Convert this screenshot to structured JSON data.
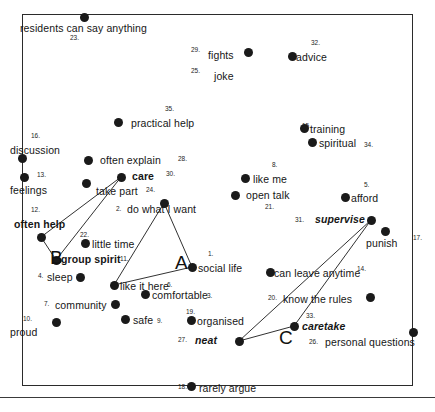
{
  "figure": {
    "type": "scatter",
    "title": "",
    "frame": {
      "x": 22,
      "y": 14,
      "width": 391,
      "height": 372
    },
    "grid": false,
    "legend": false,
    "point_color": "#1a1a1a",
    "frame_color": "#2b2b2b"
  },
  "chart_data": {
    "type": "scatter",
    "title": "",
    "xlabel": "",
    "ylabel": "",
    "grid": false,
    "legend_position": "none",
    "points": [
      {
        "id": 23,
        "label": "residents can say anything",
        "x": 84,
        "y": 17,
        "label_x": 20,
        "label_y": 23,
        "num_x": 70,
        "num_y": 35,
        "style": "plain"
      },
      {
        "id": 29,
        "label": "fights",
        "x": 248,
        "y": 52,
        "label_x": 208,
        "label_y": 50,
        "num_x": 191,
        "num_y": 47,
        "style": "plain"
      },
      {
        "id": 25,
        "label": "joke",
        "x": null,
        "y": null,
        "label_x": 214,
        "label_y": 71,
        "num_x": 191,
        "num_y": 68,
        "style": "plain"
      },
      {
        "id": 32,
        "label": "advice",
        "x": 292,
        "y": 56,
        "label_x": 296,
        "label_y": 52,
        "num_x": 311,
        "num_y": 40,
        "style": "plain"
      },
      {
        "id": 35,
        "label": "practical help",
        "x": 118,
        "y": 122,
        "label_x": 131,
        "label_y": 118,
        "num_x": 165,
        "num_y": 106,
        "style": "plain"
      },
      {
        "id": 15,
        "label": "training",
        "x": 304,
        "y": 128,
        "label_x": 310,
        "label_y": 124,
        "num_x": 302,
        "num_y": 123,
        "style": "plain"
      },
      {
        "id": 34,
        "label": "spiritual",
        "x": 312,
        "y": 142,
        "label_x": 319,
        "label_y": 138,
        "num_x": 364,
        "num_y": 142,
        "style": "plain"
      },
      {
        "id": 16,
        "label": "discussion",
        "x": 22,
        "y": 158,
        "label_x": 10,
        "label_y": 145,
        "num_x": 31,
        "num_y": 133,
        "style": "plain"
      },
      {
        "id": 28,
        "label": "often explain",
        "x": 88,
        "y": 160,
        "label_x": 100,
        "label_y": 155,
        "num_x": 178,
        "num_y": 156,
        "style": "plain"
      },
      {
        "id": 30,
        "label": "care",
        "x": 121,
        "y": 177,
        "label_x": 132,
        "label_y": 171,
        "num_x": 166,
        "num_y": 171,
        "style": "bold"
      },
      {
        "id": 13,
        "label": "feelings",
        "x": 24,
        "y": 177,
        "label_x": 10,
        "label_y": 185,
        "num_x": 37,
        "num_y": 172,
        "style": "plain"
      },
      {
        "id": 24,
        "label": "take part",
        "x": 86,
        "y": 183,
        "label_x": 96,
        "label_y": 186,
        "num_x": 146,
        "num_y": 187,
        "style": "plain"
      },
      {
        "id": 8,
        "label": "like me",
        "x": 245,
        "y": 178,
        "label_x": 253,
        "label_y": 174,
        "num_x": 272,
        "num_y": 162,
        "style": "plain"
      },
      {
        "id": 5,
        "label": "afford",
        "x": 345,
        "y": 197,
        "label_x": 351,
        "label_y": 193,
        "num_x": 364,
        "num_y": 182,
        "style": "plain"
      },
      {
        "id": 21,
        "label": "open talk",
        "x": 235,
        "y": 195,
        "label_x": 246,
        "label_y": 190,
        "num_x": 265,
        "num_y": 204,
        "style": "plain"
      },
      {
        "id": 2,
        "label": "do what I want",
        "x": 164,
        "y": 203,
        "label_x": 127,
        "label_y": 204,
        "num_x": 116,
        "num_y": 206,
        "style": "plain"
      },
      {
        "id": 12,
        "label": "often help",
        "x": 41,
        "y": 237,
        "label_x": 14,
        "label_y": 219,
        "num_x": 31,
        "num_y": 207,
        "style": "bold"
      },
      {
        "id": 31,
        "label": "supervise",
        "x": 371,
        "y": 220,
        "label_x": 315,
        "label_y": 214,
        "num_x": 295,
        "num_y": 217,
        "style": "bolditalic"
      },
      {
        "id": 17,
        "label": "punish",
        "x": 385,
        "y": 231,
        "label_x": 366,
        "label_y": 238,
        "num_x": 413,
        "num_y": 235,
        "style": "plain"
      },
      {
        "id": 22,
        "label": "little time",
        "x": 85,
        "y": 243,
        "label_x": 92,
        "label_y": 239,
        "num_x": 80,
        "num_y": 232,
        "style": "plain"
      },
      {
        "id": 11,
        "label": "group spirit",
        "x": 56,
        "y": 260,
        "label_x": 61,
        "label_y": 254,
        "num_x": 120,
        "num_y": 256,
        "style": "bold"
      },
      {
        "id": 4,
        "label": "sleep",
        "x": 80,
        "y": 277,
        "label_x": 47,
        "label_y": 272,
        "num_x": 38,
        "num_y": 273,
        "style": "plain"
      },
      {
        "id": 1,
        "label": "social life",
        "x": 192,
        "y": 267,
        "label_x": 198,
        "label_y": 263,
        "num_x": 208,
        "num_y": 251,
        "style": "plain"
      },
      {
        "id": 14,
        "label": "can leave anytime",
        "x": 270,
        "y": 272,
        "label_x": 274,
        "label_y": 268,
        "num_x": 357,
        "num_y": 266,
        "style": "plain"
      },
      {
        "id": 6,
        "label": "like it here",
        "x": 114,
        "y": 285,
        "label_x": 120,
        "label_y": 281,
        "num_x": 167,
        "num_y": 282,
        "style": "plain"
      },
      {
        "id": 3,
        "label": "comfortable",
        "x": 145,
        "y": 294,
        "label_x": 152,
        "label_y": 290,
        "num_x": 207,
        "num_y": 293,
        "style": "plain"
      },
      {
        "id": 20,
        "label": "know the rules",
        "x": 370,
        "y": 297,
        "label_x": 283,
        "label_y": 294,
        "num_x": 268,
        "num_y": 295,
        "style": "plain"
      },
      {
        "id": 7,
        "label": "community",
        "x": 115,
        "y": 304,
        "label_x": 55,
        "label_y": 300,
        "num_x": 44,
        "num_y": 301,
        "style": "plain"
      },
      {
        "id": 9,
        "label": "safe",
        "x": 125,
        "y": 319,
        "label_x": 133,
        "label_y": 315,
        "num_x": 157,
        "num_y": 318,
        "style": "plain"
      },
      {
        "id": 19,
        "label": "organised",
        "x": 191,
        "y": 320,
        "label_x": 197,
        "label_y": 316,
        "num_x": 186,
        "num_y": 309,
        "style": "plain"
      },
      {
        "id": 33,
        "label": "caretake",
        "x": 294,
        "y": 326,
        "label_x": 302,
        "label_y": 321,
        "num_x": 306,
        "num_y": 313,
        "style": "bolditalic"
      },
      {
        "id": 10,
        "label": "proud",
        "x": 56,
        "y": 322,
        "label_x": 10,
        "label_y": 327,
        "num_x": 23,
        "num_y": 316,
        "style": "plain"
      },
      {
        "id": 27,
        "label": "neat",
        "x": 239,
        "y": 341,
        "label_x": 195,
        "label_y": 335,
        "num_x": 178,
        "num_y": 337,
        "style": "bolditalic"
      },
      {
        "id": 26,
        "label": "personal questions",
        "x": 413,
        "y": 332,
        "label_x": 325,
        "label_y": 337,
        "num_x": 309,
        "num_y": 339,
        "style": "plain"
      },
      {
        "id": 18,
        "label": "rarely argue",
        "x": 191,
        "y": 386,
        "label_x": 199,
        "label_y": 383,
        "num_x": 178,
        "num_y": 384,
        "style": "plain"
      }
    ],
    "clusters": [
      {
        "name": "A",
        "x": 175,
        "y": 253
      },
      {
        "name": "B",
        "x": 50,
        "y": 248
      },
      {
        "name": "C",
        "x": 279,
        "y": 328
      }
    ],
    "links": [
      {
        "from": 30,
        "to": 12
      },
      {
        "from": 30,
        "to": 11
      },
      {
        "from": 12,
        "to": 11
      },
      {
        "from": 2,
        "to": 6
      },
      {
        "from": 2,
        "to": 1
      },
      {
        "from": 1,
        "to": 6
      },
      {
        "from": 31,
        "to": 27
      },
      {
        "from": 31,
        "to": 33
      },
      {
        "from": 33,
        "to": 27
      }
    ]
  }
}
